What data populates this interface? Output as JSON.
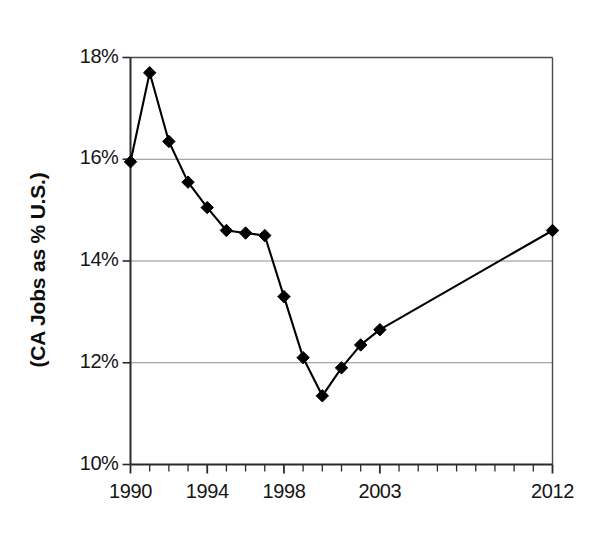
{
  "chart_data": {
    "type": "line",
    "title": "",
    "subtitle": "",
    "xlabel": "",
    "ylabel": "(CA Jobs as % U.S.)",
    "grid": "horizontal",
    "legend": "none",
    "xlim": [
      1990,
      2012
    ],
    "ylim": [
      10,
      18
    ],
    "y_tick_labels": [
      "18%",
      "16%",
      "14%",
      "12%",
      "10%"
    ],
    "y_tick_values": [
      18,
      16,
      14,
      12,
      10
    ],
    "x_tick_labels": [
      "1990",
      "1994",
      "1998",
      "2003",
      "2012"
    ],
    "x_tick_values": [
      1990,
      1994,
      1998,
      2003,
      2012
    ],
    "x_minor_tick_step": 1,
    "series": [
      {
        "name": "CA Jobs as % U.S.",
        "marker": "diamond",
        "color": "#000000",
        "x": [
          1990,
          1991,
          1992,
          1993,
          1994,
          1995,
          1996,
          1997,
          1998,
          1999,
          2000,
          2001,
          2002,
          2003,
          2012
        ],
        "values": [
          15.95,
          17.7,
          16.35,
          15.55,
          15.05,
          14.6,
          14.55,
          14.5,
          13.3,
          12.1,
          11.35,
          11.9,
          12.35,
          12.65,
          14.6
        ]
      }
    ]
  },
  "axis": {
    "y_label_text": "(CA Jobs as % U.S.)"
  }
}
